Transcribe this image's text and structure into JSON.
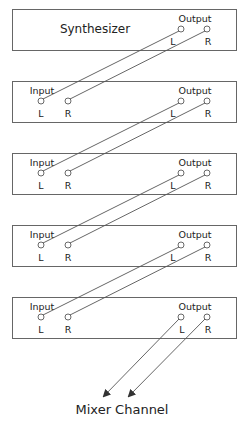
{
  "diagram": {
    "colors": {
      "line": "#555555",
      "text": "#222222",
      "box": "#666666"
    },
    "source": {
      "label": "Synthesizer",
      "output_label": "Output",
      "left": "L",
      "right": "R"
    },
    "effects": [
      {
        "input_label": "Input",
        "output_label": "Output",
        "left": "L",
        "right": "R"
      },
      {
        "input_label": "Input",
        "output_label": "Output",
        "left": "L",
        "right": "R"
      },
      {
        "input_label": "Input",
        "output_label": "Output",
        "left": "L",
        "right": "R"
      },
      {
        "input_label": "Input",
        "output_label": "Output",
        "left": "L",
        "right": "R"
      }
    ],
    "destination": {
      "label": "Mixer Channel"
    }
  }
}
